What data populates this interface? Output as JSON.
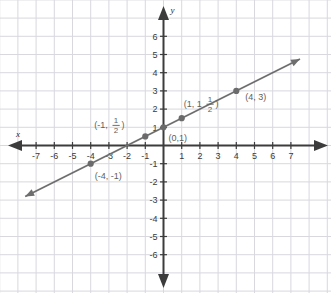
{
  "chart_data": {
    "type": "line",
    "title": "",
    "xlabel": "x",
    "ylabel": "y",
    "xlim": [
      -7.8,
      7.8
    ],
    "ylim": [
      -6.8,
      6.8
    ],
    "grid": true,
    "legend": "none",
    "equation": "y = 1/2 x + 1",
    "slope": 0.5,
    "intercept": 1,
    "line": {
      "from": [
        -7.6,
        -2.8
      ],
      "to": [
        7.5,
        4.75
      ],
      "arrows": "both",
      "color": "#6e6e6e"
    },
    "x_ticks": [
      -7,
      -6,
      -5,
      -4,
      -3,
      -2,
      -1,
      1,
      2,
      3,
      4,
      5,
      6,
      7
    ],
    "y_ticks": [
      -6,
      -5,
      -4,
      -3,
      -2,
      -1,
      1,
      2,
      3,
      4,
      5,
      6
    ],
    "x_tick_labels": [
      "-7",
      "-6",
      "-5",
      "-4",
      "-3",
      "-2",
      "-1",
      "1",
      "2",
      "3",
      "4",
      "5",
      "6",
      "7"
    ],
    "y_tick_labels": [
      "-6",
      "-5",
      "-4",
      "-3",
      "-2",
      "-1",
      "1",
      "2",
      "3",
      "4",
      "5",
      "6"
    ],
    "points": [
      {
        "x": -4,
        "y": -1,
        "label": "(-4, -1)",
        "label_dx": 4,
        "label_dy": 15
      },
      {
        "x": -1,
        "y": 0.5,
        "label": "(-1, 1/2)",
        "label_dx": -48,
        "label_dy": -10
      },
      {
        "x": 0,
        "y": 1,
        "label": "(0,1)",
        "label_dx": 5,
        "label_dy": 13
      },
      {
        "x": 1,
        "y": 1.5,
        "label": "(1, 1 1/2)",
        "label_dx": 2,
        "label_dy": -12
      },
      {
        "x": 4,
        "y": 3,
        "label": "(4, 3)",
        "label_dx": 8,
        "label_dy": 9
      }
    ]
  },
  "labels": {
    "x_axis_name": "x",
    "y_axis_name": "y",
    "point_neg4_neg1": "(-4, -1)",
    "point_neg1_half_open": "(-1,",
    "point_neg1_half_close": ")",
    "point_0_1": "(0,1)",
    "point_1_onehalf_open": "(1, 1",
    "point_1_onehalf_close": ")",
    "point_4_3": "(4, 3)",
    "fraction_numerator": "1",
    "fraction_denominator": "2"
  },
  "ticks": {
    "x_neg": [
      "-7",
      "-6",
      "-5",
      "-4",
      "-3",
      "-2",
      "-1"
    ],
    "x_pos": [
      "1",
      "2",
      "3",
      "4",
      "5",
      "6",
      "7"
    ],
    "y_pos": [
      "1",
      "2",
      "3",
      "4",
      "5",
      "6"
    ],
    "y_neg": [
      "-1",
      "-2",
      "-3",
      "-4",
      "-5",
      "-6"
    ]
  },
  "colors": {
    "grid": "#d8d8de",
    "axis": "#3c3c3c",
    "line": "#6e6e6e",
    "point": "#6b6b6b",
    "label": "#5e5e5e",
    "background": "#ffffff"
  }
}
